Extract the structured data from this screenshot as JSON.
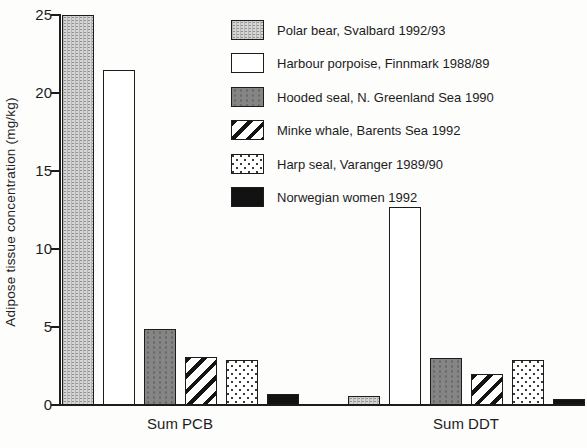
{
  "figure": {
    "background_color": "#fdfdfc",
    "line_color": "#1c1c1c"
  },
  "chart_data": {
    "type": "bar",
    "title": "",
    "xlabel": "",
    "ylabel": "Adipose tissue concentration (mg/kg)",
    "ylim": [
      0,
      25
    ],
    "yticks": [
      0,
      5,
      10,
      15,
      20,
      25
    ],
    "grid": false,
    "legend_position": "upper right",
    "groups": [
      "Sum PCB",
      "Sum DDT"
    ],
    "series": [
      {
        "name": "Polar bear, Svalbard 1992/93",
        "pattern": "polar",
        "values": [
          25.0,
          0.6
        ]
      },
      {
        "name": "Harbour porpoise, Finnmark 1988/89",
        "pattern": "porpoise",
        "values": [
          21.5,
          12.7
        ]
      },
      {
        "name": "Hooded seal, N. Greenland Sea 1990",
        "pattern": "hooded",
        "values": [
          4.9,
          3.0
        ]
      },
      {
        "name": "Minke whale, Barents Sea 1992",
        "pattern": "minke",
        "values": [
          3.1,
          2.0
        ]
      },
      {
        "name": "Harp seal, Varanger 1989/90",
        "pattern": "harp",
        "values": [
          2.9,
          2.9
        ]
      },
      {
        "name": "Norwegian women 1992",
        "pattern": "women",
        "values": [
          0.7,
          0.4
        ]
      }
    ],
    "pattern_colors": {
      "bar_outline": "#1c1c1c",
      "polar_fill": "#d6d6d6",
      "polar_dot": "#8f8f8f",
      "porpoise_fill": "#ffffff",
      "hooded_fill": "#858585",
      "hooded_dot": "#696969",
      "minke_stripe": "#141414",
      "harp_fill": "#ffffff",
      "harp_dot": "#3a3a3a",
      "women_fill": "#121212"
    }
  }
}
